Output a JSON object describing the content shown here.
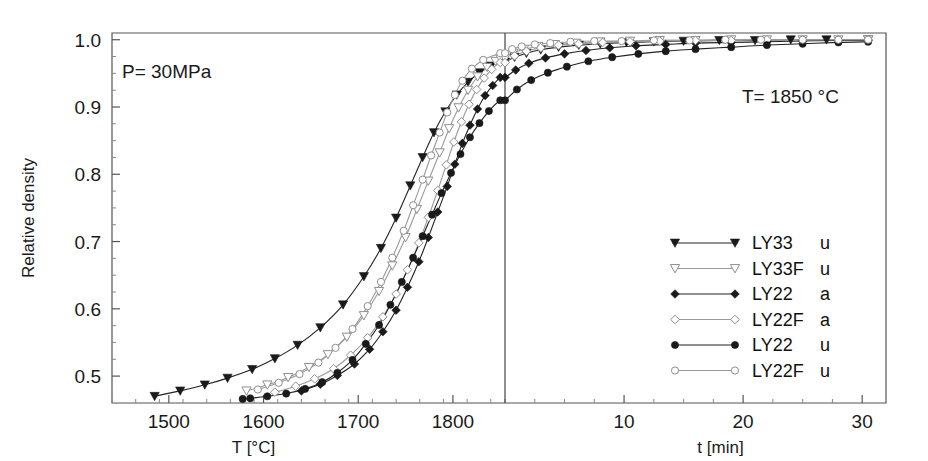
{
  "chart_data": {
    "type": "line",
    "title": "",
    "annotations": [
      {
        "name": "pressure-annotation",
        "text": "P= 30MPa",
        "x_px": 122,
        "y_px": 78
      },
      {
        "name": "temperature-annotation",
        "text": "T= 1850 °C",
        "x_px": 742,
        "y_px": 103
      }
    ],
    "ylabel": "Relative density",
    "ylim": [
      0.46,
      1.01
    ],
    "yticks": [
      0.5,
      0.6,
      0.7,
      0.8,
      0.9,
      1.0
    ],
    "ytick_labels": [
      "0.5",
      "0.6",
      "0.7",
      "0.8",
      "0.9",
      "1.0"
    ],
    "yminor_step": 0.025,
    "grid": false,
    "legend_position": "right-middle",
    "axes": [
      {
        "name": "temperature-axis",
        "xlabel": "T [°C]",
        "xlim": [
          1440,
          1855
        ],
        "xticks": [
          1500,
          1600,
          1700,
          1800
        ],
        "xtick_labels": [
          "1500",
          "1600",
          "1700",
          "1800"
        ],
        "xminor_step": 25
      },
      {
        "name": "time-axis",
        "xlabel": "t [min]",
        "xlim": [
          0,
          32
        ],
        "xticks": [
          10,
          20,
          30
        ],
        "xtick_labels": [
          "10",
          "20",
          "30"
        ],
        "xminor_step": 2.5
      }
    ],
    "series": [
      {
        "name": "LY33 u",
        "label": "LY33",
        "suffix": "u",
        "marker": "triangle-down-filled",
        "color": "#1a1a1a",
        "heating_points": [
          [
            1485,
            0.47
          ],
          [
            1512,
            0.478
          ],
          [
            1538,
            0.487
          ],
          [
            1562,
            0.497
          ],
          [
            1588,
            0.51
          ],
          [
            1612,
            0.526
          ],
          [
            1636,
            0.546
          ],
          [
            1660,
            0.572
          ],
          [
            1684,
            0.606
          ],
          [
            1706,
            0.648
          ],
          [
            1724,
            0.69
          ],
          [
            1740,
            0.735
          ],
          [
            1755,
            0.783
          ],
          [
            1768,
            0.825
          ],
          [
            1780,
            0.862
          ],
          [
            1792,
            0.893
          ],
          [
            1804,
            0.918
          ],
          [
            1816,
            0.937
          ],
          [
            1828,
            0.951
          ],
          [
            1840,
            0.961
          ],
          [
            1850,
            0.967
          ]
        ],
        "hold_points": [
          [
            0.0,
            0.967
          ],
          [
            0.8,
            0.974
          ],
          [
            1.8,
            0.98
          ],
          [
            3.0,
            0.985
          ],
          [
            4.5,
            0.989
          ],
          [
            6.2,
            0.992
          ],
          [
            8.0,
            0.994
          ],
          [
            10.2,
            0.996
          ],
          [
            12.5,
            0.997
          ],
          [
            15.0,
            0.998
          ],
          [
            18.0,
            0.999
          ],
          [
            21.0,
            0.999
          ],
          [
            24.0,
            1.0
          ],
          [
            27.0,
            1.0
          ],
          [
            30.5,
            1.0
          ]
        ]
      },
      {
        "name": "LY33F u",
        "label": "LY33F",
        "suffix": "u",
        "marker": "triangle-down-open",
        "color": "#9a9a9a",
        "heating_points": [
          [
            1582,
            0.478
          ],
          [
            1604,
            0.487
          ],
          [
            1626,
            0.498
          ],
          [
            1648,
            0.513
          ],
          [
            1668,
            0.532
          ],
          [
            1688,
            0.558
          ],
          [
            1706,
            0.59
          ],
          [
            1722,
            0.626
          ],
          [
            1736,
            0.664
          ],
          [
            1750,
            0.706
          ],
          [
            1762,
            0.748
          ],
          [
            1774,
            0.79
          ],
          [
            1786,
            0.832
          ],
          [
            1796,
            0.868
          ],
          [
            1806,
            0.899
          ],
          [
            1816,
            0.925
          ],
          [
            1826,
            0.945
          ],
          [
            1836,
            0.959
          ],
          [
            1845,
            0.968
          ],
          [
            1850,
            0.972
          ]
        ],
        "hold_points": [
          [
            0.0,
            0.972
          ],
          [
            0.7,
            0.98
          ],
          [
            1.6,
            0.986
          ],
          [
            2.8,
            0.99
          ],
          [
            4.2,
            0.993
          ],
          [
            6.0,
            0.995
          ],
          [
            8.0,
            0.997
          ],
          [
            10.5,
            0.998
          ],
          [
            13.0,
            0.999
          ],
          [
            16.0,
            0.999
          ],
          [
            19.0,
            1.0
          ],
          [
            22.0,
            1.0
          ],
          [
            25.0,
            1.0
          ],
          [
            28.0,
            1.0
          ],
          [
            30.5,
            1.0
          ]
        ]
      },
      {
        "name": "LY22 a",
        "label": "LY22",
        "suffix": "a",
        "marker": "diamond-filled",
        "color": "#1a1a1a",
        "heating_points": [
          [
            1640,
            0.478
          ],
          [
            1660,
            0.488
          ],
          [
            1678,
            0.501
          ],
          [
            1696,
            0.518
          ],
          [
            1712,
            0.54
          ],
          [
            1726,
            0.566
          ],
          [
            1740,
            0.598
          ],
          [
            1752,
            0.632
          ],
          [
            1764,
            0.67
          ],
          [
            1774,
            0.706
          ],
          [
            1784,
            0.744
          ],
          [
            1794,
            0.782
          ],
          [
            1802,
            0.815
          ],
          [
            1810,
            0.846
          ],
          [
            1818,
            0.873
          ],
          [
            1826,
            0.897
          ],
          [
            1834,
            0.917
          ],
          [
            1842,
            0.932
          ],
          [
            1850,
            0.944
          ]
        ],
        "hold_points": [
          [
            0.0,
            0.944
          ],
          [
            0.9,
            0.955
          ],
          [
            2.0,
            0.965
          ],
          [
            3.4,
            0.973
          ],
          [
            5.0,
            0.979
          ],
          [
            6.8,
            0.984
          ],
          [
            8.8,
            0.988
          ],
          [
            11.0,
            0.991
          ],
          [
            13.5,
            0.993
          ],
          [
            16.0,
            0.995
          ],
          [
            19.0,
            0.996
          ],
          [
            22.0,
            0.997
          ],
          [
            25.0,
            0.998
          ],
          [
            28.0,
            0.999
          ],
          [
            30.5,
            0.999
          ]
        ]
      },
      {
        "name": "LY22F a",
        "label": "LY22F",
        "suffix": "a",
        "marker": "diamond-open",
        "color": "#9a9a9a",
        "heating_points": [
          [
            1612,
            0.476
          ],
          [
            1634,
            0.485
          ],
          [
            1654,
            0.496
          ],
          [
            1674,
            0.511
          ],
          [
            1692,
            0.531
          ],
          [
            1710,
            0.557
          ],
          [
            1726,
            0.588
          ],
          [
            1740,
            0.622
          ],
          [
            1752,
            0.658
          ],
          [
            1764,
            0.698
          ],
          [
            1774,
            0.736
          ],
          [
            1784,
            0.776
          ],
          [
            1793,
            0.814
          ],
          [
            1801,
            0.848
          ],
          [
            1809,
            0.878
          ],
          [
            1817,
            0.904
          ],
          [
            1825,
            0.926
          ],
          [
            1833,
            0.943
          ],
          [
            1841,
            0.956
          ],
          [
            1850,
            0.966
          ]
        ],
        "hold_points": [
          [
            0.0,
            0.966
          ],
          [
            0.8,
            0.976
          ],
          [
            1.8,
            0.983
          ],
          [
            3.0,
            0.988
          ],
          [
            4.5,
            0.992
          ],
          [
            6.2,
            0.994
          ],
          [
            8.2,
            0.996
          ],
          [
            10.5,
            0.997
          ],
          [
            13.0,
            0.998
          ],
          [
            16.0,
            0.999
          ],
          [
            19.0,
            0.999
          ],
          [
            22.0,
            1.0
          ],
          [
            25.0,
            1.0
          ],
          [
            28.0,
            1.0
          ],
          [
            30.5,
            1.0
          ]
        ]
      },
      {
        "name": "LY22 u",
        "label": "LY22",
        "suffix": "u",
        "marker": "circle-filled",
        "color": "#1a1a1a",
        "heating_points": [
          [
            1578,
            0.466
          ],
          [
            1586,
            0.467
          ],
          [
            1604,
            0.47
          ],
          [
            1624,
            0.474
          ],
          [
            1644,
            0.481
          ],
          [
            1662,
            0.491
          ],
          [
            1678,
            0.505
          ],
          [
            1694,
            0.524
          ],
          [
            1708,
            0.548
          ],
          [
            1722,
            0.576
          ],
          [
            1734,
            0.606
          ],
          [
            1746,
            0.64
          ],
          [
            1758,
            0.676
          ],
          [
            1768,
            0.708
          ],
          [
            1778,
            0.74
          ],
          [
            1788,
            0.772
          ],
          [
            1798,
            0.802
          ],
          [
            1808,
            0.83
          ],
          [
            1818,
            0.855
          ],
          [
            1828,
            0.876
          ],
          [
            1838,
            0.894
          ],
          [
            1850,
            0.91
          ]
        ],
        "hold_points": [
          [
            0.0,
            0.91
          ],
          [
            1.0,
            0.926
          ],
          [
            2.2,
            0.94
          ],
          [
            3.6,
            0.951
          ],
          [
            5.2,
            0.96
          ],
          [
            7.0,
            0.968
          ],
          [
            9.0,
            0.974
          ],
          [
            11.2,
            0.979
          ],
          [
            13.5,
            0.983
          ],
          [
            16.0,
            0.986
          ],
          [
            19.0,
            0.989
          ],
          [
            22.0,
            0.992
          ],
          [
            25.0,
            0.994
          ],
          [
            28.0,
            0.996
          ],
          [
            30.5,
            0.997
          ]
        ]
      },
      {
        "name": "LY22F u",
        "label": "LY22F",
        "suffix": "u",
        "marker": "circle-open",
        "color": "#9a9a9a",
        "heating_points": [
          [
            1594,
            0.48
          ],
          [
            1616,
            0.49
          ],
          [
            1638,
            0.503
          ],
          [
            1658,
            0.52
          ],
          [
            1676,
            0.542
          ],
          [
            1694,
            0.57
          ],
          [
            1710,
            0.604
          ],
          [
            1724,
            0.64
          ],
          [
            1736,
            0.676
          ],
          [
            1748,
            0.716
          ],
          [
            1758,
            0.754
          ],
          [
            1768,
            0.792
          ],
          [
            1777,
            0.828
          ],
          [
            1786,
            0.862
          ],
          [
            1794,
            0.892
          ],
          [
            1802,
            0.918
          ],
          [
            1810,
            0.939
          ],
          [
            1820,
            0.957
          ],
          [
            1832,
            0.97
          ],
          [
            1850,
            0.98
          ]
        ],
        "hold_points": [
          [
            0.0,
            0.98
          ],
          [
            0.6,
            0.986
          ],
          [
            1.4,
            0.99
          ],
          [
            2.5,
            0.993
          ],
          [
            3.8,
            0.995
          ],
          [
            5.5,
            0.997
          ],
          [
            7.5,
            0.998
          ],
          [
            9.8,
            0.998
          ],
          [
            12.5,
            0.999
          ],
          [
            15.5,
            0.999
          ],
          [
            18.5,
            1.0
          ],
          [
            21.5,
            1.0
          ],
          [
            25.0,
            1.0
          ],
          [
            28.0,
            1.0
          ],
          [
            30.5,
            1.0
          ]
        ]
      }
    ]
  },
  "legend": {
    "name": "series-legend",
    "entries": [
      {
        "label": "LY33",
        "suffix": "u",
        "marker": "triangle-down-filled"
      },
      {
        "label": "LY33F",
        "suffix": "u",
        "marker": "triangle-down-open"
      },
      {
        "label": "LY22",
        "suffix": "a",
        "marker": "diamond-filled"
      },
      {
        "label": "LY22F",
        "suffix": "a",
        "marker": "diamond-open"
      },
      {
        "label": "LY22",
        "suffix": "u",
        "marker": "circle-filled"
      },
      {
        "label": "LY22F",
        "suffix": "u",
        "marker": "circle-open"
      }
    ]
  },
  "layout": {
    "plot_left_px": 112,
    "plot_right_px": 886,
    "plot_top_px": 33,
    "plot_bottom_px": 403,
    "divider_x_px": 505
  }
}
